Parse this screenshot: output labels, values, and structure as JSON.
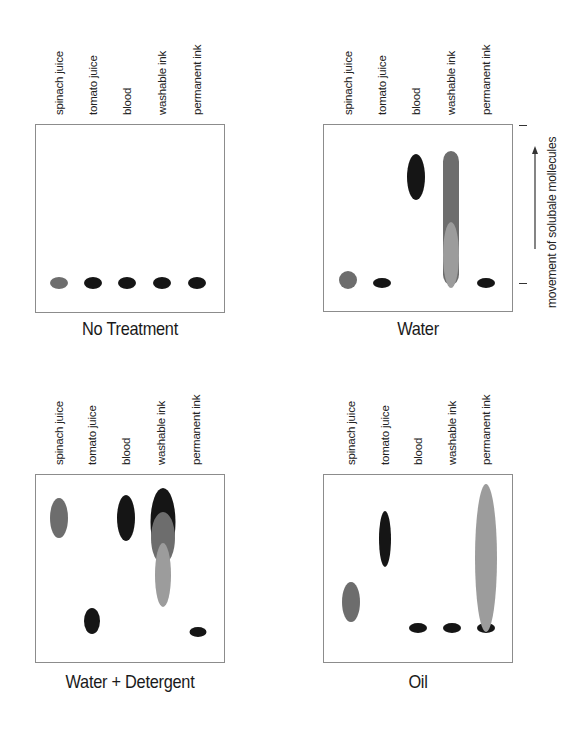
{
  "lanes": [
    "spinach juice",
    "tomato juice",
    "blood",
    "washable ink",
    "permanent ink"
  ],
  "axis": {
    "label": "movement of solubale mollecules",
    "arrow": "up"
  },
  "colors": {
    "dark": "#151515",
    "mid": "#6d6d6d",
    "light": "#9c9c9c",
    "box_border": "#8c8c8c"
  },
  "panels": [
    {
      "title": "No Treatment",
      "box": {
        "x": 35,
        "y": 124,
        "w": 190,
        "h": 189
      },
      "lane_x": [
        59,
        93,
        127,
        162,
        197
      ],
      "label_bottom": 115,
      "title_y": 318,
      "spots": [
        {
          "lane": "spinach juice",
          "cx": 59,
          "cy": 283,
          "rx": 9,
          "ry": 6,
          "color": "mid"
        },
        {
          "lane": "tomato juice",
          "cx": 93,
          "cy": 283,
          "rx": 9,
          "ry": 6,
          "color": "dark"
        },
        {
          "lane": "blood",
          "cx": 127,
          "cy": 283,
          "rx": 9,
          "ry": 6,
          "color": "dark"
        },
        {
          "lane": "washable ink",
          "cx": 162,
          "cy": 283,
          "rx": 9,
          "ry": 6,
          "color": "dark"
        },
        {
          "lane": "permanent ink",
          "cx": 197,
          "cy": 283,
          "rx": 9,
          "ry": 6,
          "color": "dark"
        }
      ]
    },
    {
      "title": "Water",
      "box": {
        "x": 323,
        "y": 124,
        "w": 190,
        "h": 188
      },
      "lane_x": [
        348,
        382,
        416,
        451,
        486
      ],
      "label_bottom": 115,
      "title_y": 318,
      "spots": [
        {
          "lane": "spinach juice",
          "cx": 348,
          "cy": 280,
          "rx": 9,
          "ry": 9,
          "color": "mid"
        },
        {
          "lane": "tomato juice",
          "cx": 382,
          "cy": 283,
          "rx": 9,
          "ry": 5,
          "color": "dark"
        },
        {
          "lane": "blood",
          "cx": 416,
          "cy": 177,
          "rx": 9,
          "ry": 23,
          "color": "dark"
        },
        {
          "lane": "washable ink",
          "cx": 451,
          "cy": 218,
          "rx": 8,
          "ry": 67,
          "color": "mid",
          "shape": "band"
        },
        {
          "lane": "washable ink",
          "cx": 451,
          "cy": 255,
          "rx": 8,
          "ry": 33,
          "color": "light"
        },
        {
          "lane": "permanent ink",
          "cx": 486,
          "cy": 283,
          "rx": 9,
          "ry": 5,
          "color": "dark"
        }
      ]
    },
    {
      "title": "Water + Detergent",
      "box": {
        "x": 35,
        "y": 474,
        "w": 190,
        "h": 189
      },
      "lane_x": [
        59,
        92,
        126,
        161,
        196
      ],
      "label_bottom": 465,
      "title_y": 671,
      "spots": [
        {
          "lane": "spinach juice",
          "cx": 59,
          "cy": 518,
          "rx": 9,
          "ry": 20,
          "color": "mid"
        },
        {
          "lane": "blood",
          "cx": 126,
          "cy": 518,
          "rx": 9,
          "ry": 23,
          "color": "dark"
        },
        {
          "lane": "washable ink",
          "cx": 163,
          "cy": 522,
          "rx": 12.5,
          "ry": 34,
          "color": "dark"
        },
        {
          "lane": "washable ink",
          "cx": 163,
          "cy": 538,
          "rx": 12,
          "ry": 26,
          "color": "mid"
        },
        {
          "lane": "washable ink",
          "cx": 163,
          "cy": 575,
          "rx": 8,
          "ry": 32,
          "color": "light"
        },
        {
          "lane": "tomato juice",
          "cx": 92,
          "cy": 621,
          "rx": 8,
          "ry": 13,
          "color": "dark"
        },
        {
          "lane": "permanent ink",
          "cx": 198,
          "cy": 632,
          "rx": 8.5,
          "ry": 5,
          "color": "dark"
        }
      ]
    },
    {
      "title": "Oil",
      "box": {
        "x": 323,
        "y": 474,
        "w": 190,
        "h": 189
      },
      "lane_x": [
        351,
        385,
        418,
        452,
        486
      ],
      "label_bottom": 465,
      "title_y": 671,
      "spots": [
        {
          "lane": "spinach juice",
          "cx": 351,
          "cy": 602,
          "rx": 9,
          "ry": 20,
          "color": "mid"
        },
        {
          "lane": "tomato juice",
          "cx": 385,
          "cy": 539,
          "rx": 6,
          "ry": 28,
          "color": "dark"
        },
        {
          "lane": "blood",
          "cx": 418,
          "cy": 628,
          "rx": 9,
          "ry": 5,
          "color": "dark"
        },
        {
          "lane": "washable ink",
          "cx": 452,
          "cy": 628,
          "rx": 9,
          "ry": 5,
          "color": "dark"
        },
        {
          "lane": "permanent ink",
          "cx": 486,
          "cy": 628,
          "rx": 9,
          "ry": 5,
          "color": "dark"
        },
        {
          "lane": "permanent ink",
          "cx": 486,
          "cy": 558,
          "rx": 11,
          "ry": 74,
          "color": "light"
        }
      ]
    }
  ]
}
